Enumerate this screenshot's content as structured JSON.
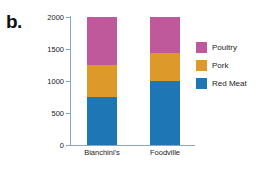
{
  "panel": {
    "label": "b."
  },
  "chart_data": {
    "type": "bar",
    "subtype": "stacked-bar",
    "title": "",
    "xlabel": "",
    "ylabel": "",
    "ylim": [
      0,
      2000
    ],
    "yticks": [
      0,
      500,
      1000,
      1500,
      2000
    ],
    "ytick_labels": [
      "0",
      "500",
      "1000",
      "1500",
      "2000"
    ],
    "grid": false,
    "legend_position": "right",
    "categories": [
      "Bianchini's",
      "Foodville"
    ],
    "stack_order_bottom_to_top": [
      "Red Meat",
      "Pork",
      "Poultry"
    ],
    "series": [
      {
        "name": "Red Meat",
        "color": "#1f76b4",
        "values": [
          750,
          1000
        ]
      },
      {
        "name": "Pork",
        "color": "#dd9a2a",
        "values": [
          500,
          430
        ]
      },
      {
        "name": "Poultry",
        "color": "#c0599b",
        "values": [
          750,
          570
        ]
      }
    ],
    "totals": [
      2000,
      2000
    ]
  },
  "legend": {
    "items": [
      {
        "label": "Poultry",
        "color": "#c0599b"
      },
      {
        "label": "Pork",
        "color": "#dd9a2a"
      },
      {
        "label": "Red Meat",
        "color": "#1f76b4"
      }
    ]
  },
  "axis": {
    "color": "#8ba6bf"
  }
}
